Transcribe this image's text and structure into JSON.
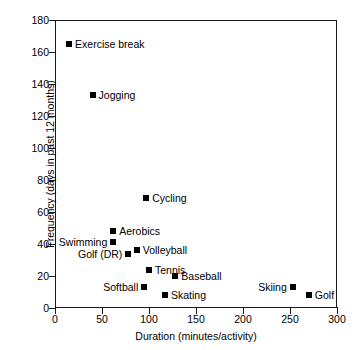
{
  "chart_data": {
    "type": "scatter",
    "title": "",
    "xlabel": "Duration (minutes/activity)",
    "ylabel": "Frequency (days in past 12 months)",
    "xlim": [
      0,
      300
    ],
    "ylim": [
      0,
      180
    ],
    "xticks": [
      0,
      50,
      100,
      150,
      200,
      250,
      300
    ],
    "yticks": [
      0,
      20,
      40,
      60,
      80,
      100,
      120,
      140,
      160,
      180
    ],
    "grid": false,
    "legend": "none",
    "marker_color": "#000000",
    "marker_shape": "square",
    "points": [
      {
        "label": "Exercise break",
        "x": 15,
        "y": 165,
        "label_side": "right"
      },
      {
        "label": "Jogging",
        "x": 40,
        "y": 133,
        "label_side": "right"
      },
      {
        "label": "Cycling",
        "x": 97,
        "y": 69,
        "label_side": "right"
      },
      {
        "label": "Aerobics",
        "x": 62,
        "y": 48,
        "label_side": "right"
      },
      {
        "label": "Swimming",
        "x": 62,
        "y": 41,
        "label_side": "left"
      },
      {
        "label": "Volleyball",
        "x": 87,
        "y": 36,
        "label_side": "right"
      },
      {
        "label": "Golf (DR)",
        "x": 78,
        "y": 34,
        "label_side": "left"
      },
      {
        "label": "Tennis",
        "x": 100,
        "y": 24,
        "label_side": "right"
      },
      {
        "label": "Baseball",
        "x": 128,
        "y": 20,
        "label_side": "right"
      },
      {
        "label": "Softball",
        "x": 95,
        "y": 13,
        "label_side": "left"
      },
      {
        "label": "Skating",
        "x": 117,
        "y": 8,
        "label_side": "right"
      },
      {
        "label": "Skiing",
        "x": 253,
        "y": 13,
        "label_side": "left"
      },
      {
        "label": "Golf",
        "x": 270,
        "y": 8,
        "label_side": "right"
      }
    ]
  }
}
